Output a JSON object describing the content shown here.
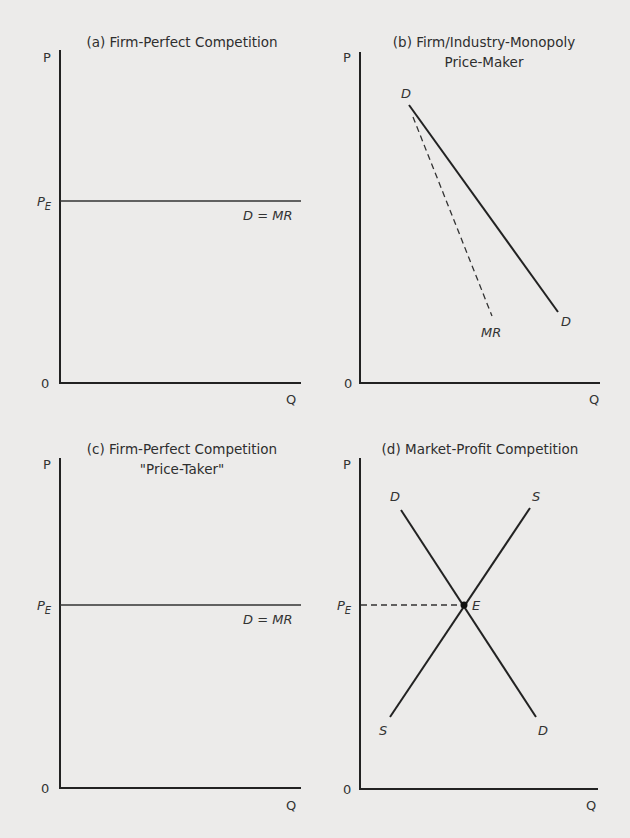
{
  "panels": [
    {
      "id": "a",
      "title_lines": [
        "(a) Firm-Perfect Competition"
      ],
      "y_axis_label": "P",
      "x_axis_label": "Q",
      "origin_label": "0",
      "price_label": "P",
      "price_subscript": "E",
      "curves": [
        {
          "name": "D = MR",
          "type": "horizontal",
          "style": "solid"
        }
      ]
    },
    {
      "id": "b",
      "title_lines": [
        "(b) Firm/Industry-Monopoly",
        "Price-Maker"
      ],
      "y_axis_label": "P",
      "x_axis_label": "Q",
      "origin_label": "0",
      "curves": [
        {
          "name": "D",
          "start_label": "D",
          "end_label": "D",
          "type": "downward",
          "style": "solid"
        },
        {
          "name": "MR",
          "end_label": "MR",
          "type": "downward-steeper",
          "style": "dashed"
        }
      ]
    },
    {
      "id": "c",
      "title_lines": [
        "(c) Firm-Perfect Competition",
        "\"Price-Taker\""
      ],
      "y_axis_label": "P",
      "x_axis_label": "Q",
      "origin_label": "0",
      "price_label": "P",
      "price_subscript": "E",
      "curves": [
        {
          "name": "D = MR",
          "type": "horizontal",
          "style": "solid"
        }
      ]
    },
    {
      "id": "d",
      "title_lines": [
        "(d) Market-Profit Competition"
      ],
      "y_axis_label": "P",
      "x_axis_label": "Q",
      "origin_label": "0",
      "price_label": "P",
      "price_subscript": "E",
      "equilibrium_label": "E",
      "curves": [
        {
          "name": "D",
          "start_label": "D",
          "end_label": "D",
          "type": "downward",
          "style": "solid"
        },
        {
          "name": "S",
          "start_label": "S",
          "end_label": "S",
          "type": "upward",
          "style": "solid"
        },
        {
          "name": "PE guide",
          "type": "horizontal",
          "style": "dashed"
        }
      ]
    }
  ],
  "colors": {
    "background": "#ecebea",
    "ink": "#222222"
  }
}
